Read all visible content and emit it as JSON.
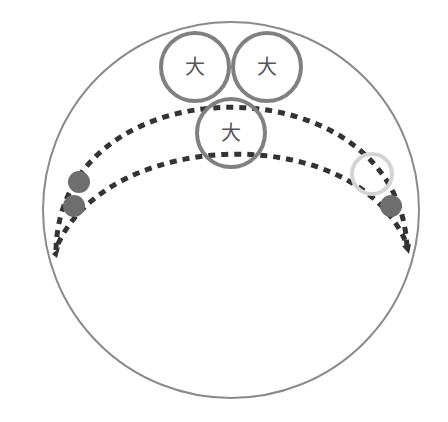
{
  "diagram": {
    "outer_circle": {
      "cx": 231,
      "cy": 210,
      "r": 188,
      "stroke": "#8a8a8a"
    },
    "dashed_arcs": [
      {
        "name": "outer-dashed-arc",
        "d": "M 56 252 C 70 80, 390 80, 407 250",
        "stroke": "#333333"
      },
      {
        "name": "inner-dashed-arc",
        "d": "M 56 246 C 110 140, 350 120, 407 245",
        "stroke": "#333333"
      }
    ],
    "labeled_circles": [
      {
        "cx": 195,
        "cy": 67,
        "r": 34,
        "label": "大"
      },
      {
        "cx": 267,
        "cy": 67,
        "r": 34,
        "label": "大"
      },
      {
        "cx": 231,
        "cy": 133,
        "r": 34,
        "label": "大"
      }
    ],
    "dots": [
      {
        "cx": 79,
        "cy": 182,
        "r": 11,
        "fill": "#6e6e6e"
      },
      {
        "cx": 74,
        "cy": 206,
        "r": 11,
        "fill": "#6e6e6e"
      },
      {
        "cx": 391,
        "cy": 206,
        "r": 11,
        "fill": "#6e6e6e"
      }
    ],
    "rings": [
      {
        "cx": 372,
        "cy": 174,
        "r": 20,
        "stroke": "#d4d4d4"
      }
    ],
    "colors": {
      "circle_stroke": "#808080",
      "dash": "#333333"
    }
  }
}
